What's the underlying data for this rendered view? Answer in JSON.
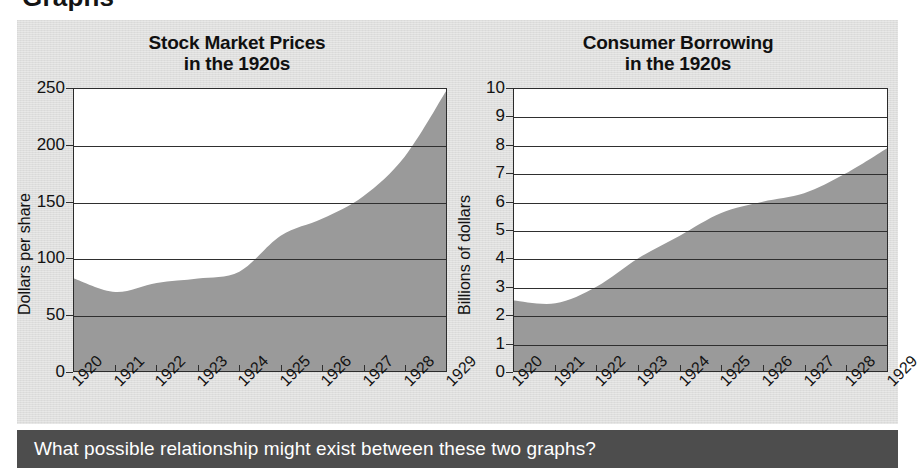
{
  "page": {
    "cut_off_heading": "Graphs",
    "background_color": "#dededd",
    "area_fill_color": "#9a9a9a",
    "caption_bar_color": "#4d4d4d"
  },
  "caption": {
    "text": "What possible relationship might exist between these two graphs?"
  },
  "chart_data": [
    {
      "id": "stock-market-prices",
      "type": "area",
      "title": "Stock Market Prices",
      "title_line2": "in the 1920s",
      "xlabel": "",
      "ylabel": "Dollars per share",
      "categories": [
        "1920",
        "1921",
        "1922",
        "1923",
        "1924",
        "1925",
        "1926",
        "1927",
        "1928",
        "1929"
      ],
      "x": [
        1920,
        1921,
        1922,
        1923,
        1924,
        1925,
        1926,
        1927,
        1928,
        1929
      ],
      "values": [
        82,
        70,
        78,
        82,
        88,
        120,
        135,
        155,
        190,
        248
      ],
      "yticks": [
        0,
        50,
        100,
        150,
        200,
        250
      ],
      "ylim": [
        0,
        250
      ],
      "grid": true,
      "legend": "none",
      "fill_color": "#9a9a9a"
    },
    {
      "id": "consumer-borrowing",
      "type": "area",
      "title": "Consumer Borrowing",
      "title_line2": "in the 1920s",
      "xlabel": "",
      "ylabel": "Billions of dollars",
      "categories": [
        "1920",
        "1921",
        "1922",
        "1923",
        "1924",
        "1925",
        "1926",
        "1927",
        "1928",
        "1929"
      ],
      "x": [
        1920,
        1921,
        1922,
        1923,
        1924,
        1925,
        1926,
        1927,
        1928,
        1929
      ],
      "values": [
        2.5,
        2.4,
        3.0,
        4.0,
        4.8,
        5.6,
        6.0,
        6.3,
        7.0,
        7.9
      ],
      "yticks": [
        0,
        1,
        2,
        3,
        4,
        5,
        6,
        7,
        8,
        9,
        10
      ],
      "ylim": [
        0,
        10
      ],
      "grid": true,
      "legend": "none",
      "fill_color": "#9a9a9a"
    }
  ]
}
